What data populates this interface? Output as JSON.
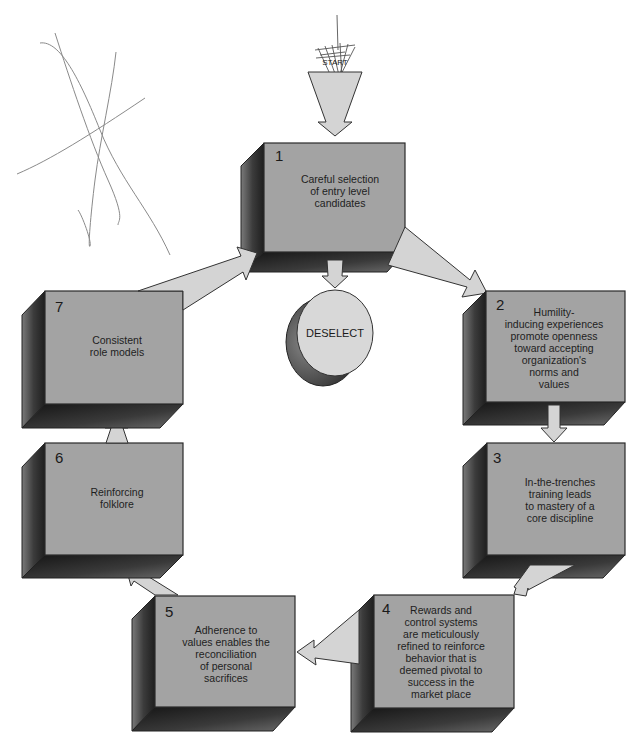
{
  "diagram": {
    "start": {
      "label": "START"
    },
    "deselect": {
      "label": "DESELECT"
    },
    "steps": [
      {
        "number": "1",
        "lines": [
          "Careful selection",
          "of entry level",
          "candidates"
        ]
      },
      {
        "number": "2",
        "lines": [
          "Humility-",
          "inducing experiences",
          "promote openness",
          "toward accepting",
          "organization's",
          "norms and",
          "values"
        ]
      },
      {
        "number": "3",
        "lines": [
          "In-the-trenches",
          "training leads",
          "to mastery of a",
          "core discipline"
        ]
      },
      {
        "number": "4",
        "lines": [
          "Rewards and",
          "control systems",
          "are meticulously",
          "refined to reinforce",
          "behavior that is",
          "deemed pivotal to",
          "success in the",
          "market place"
        ]
      },
      {
        "number": "5",
        "lines": [
          "Adherence to",
          "values enables the",
          "reconciliation",
          "of personal",
          "sacrifices"
        ]
      },
      {
        "number": "6",
        "lines": [
          "Reinforcing",
          "folklore"
        ]
      },
      {
        "number": "7",
        "lines": [
          "Consistent",
          "role models"
        ]
      }
    ],
    "flow": [
      {
        "from": "start",
        "to": "1"
      },
      {
        "from": "1",
        "to": "deselect"
      },
      {
        "from": "1",
        "to": "2"
      },
      {
        "from": "2",
        "to": "3"
      },
      {
        "from": "3",
        "to": "4"
      },
      {
        "from": "4",
        "to": "5"
      },
      {
        "from": "5",
        "to": "6"
      },
      {
        "from": "6",
        "to": "7"
      },
      {
        "from": "7",
        "to": "1"
      }
    ],
    "colors": {
      "box_face": "#a3a3a3",
      "box_side_dark": "#2e2e2e",
      "arrow_fill": "#d4d4d4",
      "deselect_face": "#d8d8d8",
      "background": "#ffffff"
    }
  }
}
